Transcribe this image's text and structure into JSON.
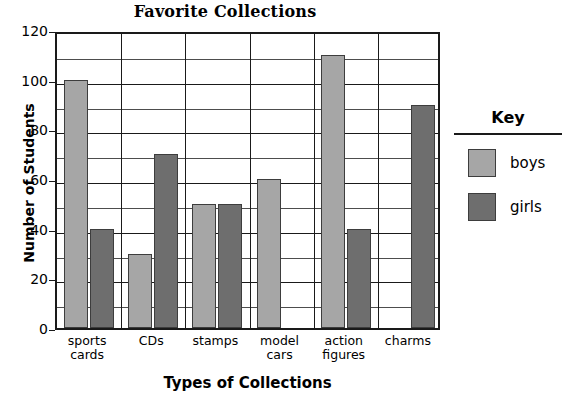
{
  "chart_data": {
    "type": "bar",
    "title": "Favorite Collections",
    "xlabel": "Types of Collections",
    "ylabel": "Number of Students",
    "categories": [
      "sports cards",
      "CDs",
      "stamps",
      "model cars",
      "action figures",
      "charms"
    ],
    "category_lines": [
      [
        "sports",
        "cards"
      ],
      [
        "CDs",
        ""
      ],
      [
        "stamps",
        ""
      ],
      [
        "model",
        "cars"
      ],
      [
        "action",
        "figures"
      ],
      [
        "charms",
        ""
      ]
    ],
    "series": [
      {
        "name": "boys",
        "color": "#a6a6a6",
        "values": [
          100,
          30,
          50,
          60,
          110,
          0
        ]
      },
      {
        "name": "girls",
        "color": "#6e6e6e",
        "values": [
          40,
          70,
          50,
          0,
          40,
          90
        ]
      }
    ],
    "ylim": [
      0,
      120
    ],
    "ytick_labels": [
      "0",
      "20",
      "40",
      "60",
      "80",
      "100",
      "120"
    ],
    "ytick_values": [
      0,
      20,
      40,
      60,
      80,
      100,
      120
    ],
    "gridline_values": [
      10,
      20,
      30,
      40,
      50,
      60,
      70,
      80,
      90,
      100,
      110
    ],
    "grid": "horizontal-every-10-with-category-dividers",
    "legend_position": "right"
  },
  "legend": {
    "title": "Key",
    "entries": [
      {
        "label": "boys",
        "color": "#a6a6a6"
      },
      {
        "label": "girls",
        "color": "#6e6e6e"
      }
    ]
  }
}
